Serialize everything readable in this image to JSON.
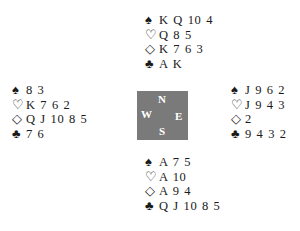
{
  "deal": {
    "north": {
      "spades": "K Q 10 4",
      "hearts": "Q 8 5",
      "diamonds": "K 7 6 3",
      "clubs": "A K"
    },
    "west": {
      "spades": "8 3",
      "hearts": "K 7 6 2",
      "diamonds": "Q J 10 8 5",
      "clubs": "7 6"
    },
    "east": {
      "spades": "J 9 6 2",
      "hearts": "J 9 4 3",
      "diamonds": "2",
      "clubs": "9 4 3 2"
    },
    "south": {
      "spades": "A 7 5",
      "hearts": "A 10",
      "diamonds": "A 9 4",
      "clubs": "Q J 10 8 5"
    }
  },
  "symbols": {
    "spade": "♠",
    "heart": "♡",
    "diamond": "◇",
    "club": "♣"
  },
  "compass": {
    "n": "N",
    "w": "W",
    "e": "E",
    "s": "S",
    "color": "#7a7a7a"
  }
}
